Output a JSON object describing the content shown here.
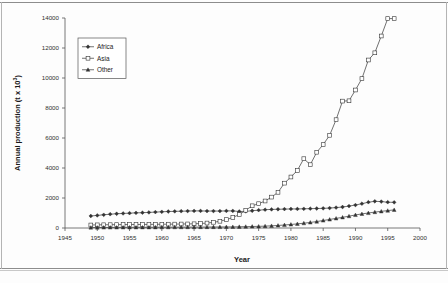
{
  "chart_data": {
    "type": "line",
    "title": "",
    "xlabel": "Year",
    "ylabel": "Annual production (t x 10³)",
    "ylabel_base": "Annual production (t x 10",
    "ylabel_exponent": "3",
    "ylabel_tail": ")",
    "xlim": [
      1945,
      2000
    ],
    "ylim": [
      0,
      14000
    ],
    "grid": false,
    "legend_position": "upper-left-inside",
    "xticks": [
      1945,
      1950,
      1955,
      1960,
      1965,
      1970,
      1975,
      1980,
      1985,
      1990,
      1995,
      2000
    ],
    "xtick_labels": [
      "1945",
      "1950",
      "1955",
      "1960",
      "1965",
      "1970",
      "1975",
      "1980",
      "1985",
      "1990",
      "1995",
      "2000"
    ],
    "yticks": [
      0,
      2000,
      4000,
      6000,
      8000,
      10000,
      12000,
      14000
    ],
    "ytick_labels": [
      "0",
      "2000",
      "4000",
      "6000",
      "8000",
      "10000",
      "12000",
      "14000"
    ],
    "x": [
      1949,
      1950,
      1951,
      1952,
      1953,
      1954,
      1955,
      1956,
      1957,
      1958,
      1959,
      1960,
      1961,
      1962,
      1963,
      1964,
      1965,
      1966,
      1967,
      1968,
      1969,
      1970,
      1971,
      1972,
      1973,
      1974,
      1975,
      1976,
      1977,
      1978,
      1979,
      1980,
      1981,
      1982,
      1983,
      1984,
      1985,
      1986,
      1987,
      1988,
      1989,
      1990,
      1991,
      1992,
      1993,
      1994,
      1995,
      1996
    ],
    "series": [
      {
        "name": "Africa",
        "marker": "filled-diamond",
        "color": "#333333",
        "values": [
          800,
          840,
          880,
          920,
          950,
          970,
          990,
          1010,
          1020,
          1040,
          1060,
          1080,
          1100,
          1110,
          1120,
          1130,
          1140,
          1140,
          1130,
          1130,
          1130,
          1140,
          1140,
          1100,
          1110,
          1150,
          1190,
          1220,
          1240,
          1250,
          1260,
          1270,
          1270,
          1280,
          1290,
          1300,
          1310,
          1330,
          1360,
          1400,
          1460,
          1530,
          1620,
          1720,
          1780,
          1760,
          1720,
          1710
        ]
      },
      {
        "name": "Asia",
        "marker": "open-square",
        "color": "#333333",
        "values": [
          200,
          210,
          215,
          220,
          225,
          230,
          230,
          235,
          235,
          240,
          245,
          250,
          255,
          260,
          265,
          270,
          280,
          300,
          330,
          380,
          450,
          560,
          700,
          900,
          1180,
          1480,
          1620,
          1800,
          2060,
          2380,
          2990,
          3400,
          3840,
          4620,
          4220,
          5050,
          5560,
          6180,
          7220,
          8460,
          8480,
          9200,
          9960,
          11200,
          11680,
          12800,
          13960,
          13960
        ]
      },
      {
        "name": "Other",
        "marker": "filled-triangle",
        "color": "#333333",
        "values": [
          30,
          32,
          34,
          36,
          38,
          40,
          42,
          44,
          45,
          46,
          48,
          50,
          52,
          54,
          56,
          58,
          60,
          62,
          64,
          66,
          68,
          70,
          75,
          82,
          90,
          100,
          110,
          125,
          145,
          170,
          200,
          235,
          275,
          320,
          370,
          430,
          500,
          570,
          640,
          710,
          790,
          870,
          940,
          1000,
          1060,
          1110,
          1160,
          1210
        ]
      }
    ]
  },
  "legend": {
    "items": [
      {
        "label": "Africa"
      },
      {
        "label": "Asia"
      },
      {
        "label": "Other"
      }
    ]
  }
}
